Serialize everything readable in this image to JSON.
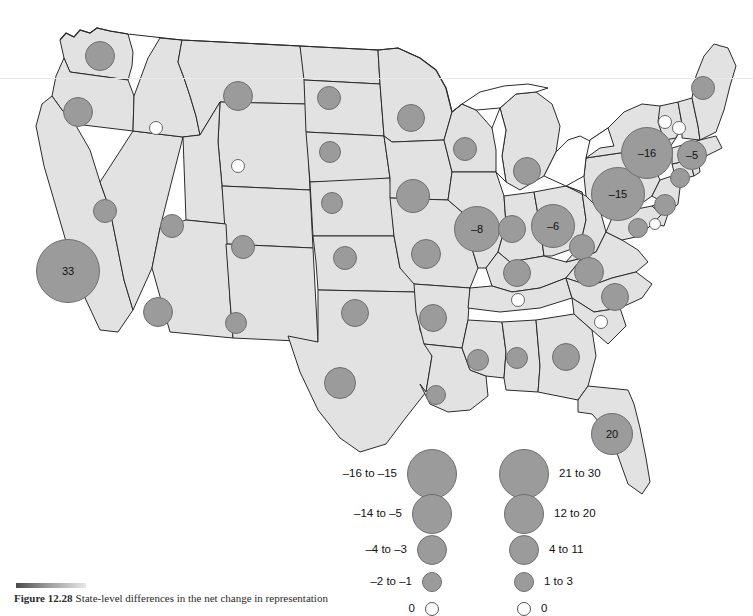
{
  "figure": {
    "caption_label": "Figure 12.28",
    "caption_text": "State-level differences in the net change in representation",
    "map_fill_color": "#e2e2e2",
    "map_stroke_color": "#2b2b2b",
    "bubble_fill_color": "#9b9b9b",
    "bubble_stroke_color": "#6f6f6f",
    "zero_fill_color": "#ffffff"
  },
  "chart_data": {
    "type": "bubble-map",
    "title": "Figure 12.28",
    "region": "United States",
    "value_unit": "net change",
    "legend": {
      "position": "bottom-center",
      "negative_column": [
        {
          "label": "-16 to -15",
          "radius_px": 25
        },
        {
          "label": "-14 to -5",
          "radius_px": 20
        },
        {
          "label": "-4 to -3",
          "radius_px": 15
        },
        {
          "label": "-2 to -1",
          "radius_px": 10
        },
        {
          "label": "0",
          "radius_px": 7
        }
      ],
      "positive_column": [
        {
          "label": "21 to 30",
          "radius_px": 25
        },
        {
          "label": "12 to 20",
          "radius_px": 20
        },
        {
          "label": "4 to 11",
          "radius_px": 15
        },
        {
          "label": "1 to 3",
          "radius_px": 10
        },
        {
          "label": "0",
          "radius_px": 7
        }
      ]
    },
    "labeled_values": [
      {
        "state": "California",
        "value": 33
      },
      {
        "state": "Florida",
        "value": 20
      },
      {
        "state": "New York",
        "value": -16
      },
      {
        "state": "Pennsylvania",
        "value": -15
      },
      {
        "state": "Illinois",
        "value": -8
      },
      {
        "state": "Ohio",
        "value": -6
      },
      {
        "state": "Massachusetts",
        "value": -5
      }
    ],
    "zero_states": [
      "Idaho",
      "Wyoming",
      "Tennessee",
      "South Carolina",
      "Vermont",
      "New Hampshire",
      "Delaware"
    ],
    "bubbles": [
      {
        "state": "Washington",
        "x": 100,
        "y": 56,
        "r": 15,
        "kind": "pos",
        "label": ""
      },
      {
        "state": "Oregon",
        "x": 78,
        "y": 112,
        "r": 15,
        "kind": "pos",
        "label": ""
      },
      {
        "state": "Idaho",
        "x": 156,
        "y": 128,
        "r": 7,
        "kind": "zero",
        "label": ""
      },
      {
        "state": "Montana",
        "x": 238,
        "y": 96,
        "r": 15,
        "kind": "pos",
        "label": ""
      },
      {
        "state": "Wyoming",
        "x": 238,
        "y": 166,
        "r": 7,
        "kind": "zero",
        "label": ""
      },
      {
        "state": "Nevada",
        "x": 105,
        "y": 211,
        "r": 12,
        "kind": "pos",
        "label": ""
      },
      {
        "state": "Utah",
        "x": 172,
        "y": 226,
        "r": 12,
        "kind": "pos",
        "label": ""
      },
      {
        "state": "Colorado",
        "x": 243,
        "y": 247,
        "r": 12,
        "kind": "pos",
        "label": ""
      },
      {
        "state": "Arizona",
        "x": 158,
        "y": 312,
        "r": 15,
        "kind": "pos",
        "label": ""
      },
      {
        "state": "New Mexico",
        "x": 236,
        "y": 323,
        "r": 11,
        "kind": "pos",
        "label": ""
      },
      {
        "state": "California",
        "x": 68,
        "y": 271,
        "r": 32,
        "kind": "pos",
        "label": "33"
      },
      {
        "state": "North Dakota",
        "x": 329,
        "y": 98,
        "r": 12,
        "kind": "pos",
        "label": ""
      },
      {
        "state": "South Dakota",
        "x": 330,
        "y": 152,
        "r": 11,
        "kind": "pos",
        "label": ""
      },
      {
        "state": "Nebraska",
        "x": 332,
        "y": 203,
        "r": 11,
        "kind": "pos",
        "label": ""
      },
      {
        "state": "Kansas",
        "x": 345,
        "y": 258,
        "r": 12,
        "kind": "pos",
        "label": ""
      },
      {
        "state": "Oklahoma",
        "x": 355,
        "y": 313,
        "r": 14,
        "kind": "pos",
        "label": ""
      },
      {
        "state": "Texas",
        "x": 340,
        "y": 383,
        "r": 16,
        "kind": "pos",
        "label": ""
      },
      {
        "state": "Minnesota",
        "x": 411,
        "y": 118,
        "r": 14,
        "kind": "pos",
        "label": ""
      },
      {
        "state": "Iowa",
        "x": 413,
        "y": 196,
        "r": 17,
        "kind": "pos",
        "label": ""
      },
      {
        "state": "Missouri",
        "x": 426,
        "y": 254,
        "r": 15,
        "kind": "pos",
        "label": ""
      },
      {
        "state": "Arkansas",
        "x": 433,
        "y": 318,
        "r": 14,
        "kind": "pos",
        "label": ""
      },
      {
        "state": "Louisiana",
        "x": 436,
        "y": 395,
        "r": 10,
        "kind": "pos",
        "label": ""
      },
      {
        "state": "Wisconsin",
        "x": 465,
        "y": 149,
        "r": 12,
        "kind": "pos",
        "label": ""
      },
      {
        "state": "Illinois",
        "x": 477,
        "y": 229,
        "r": 23,
        "kind": "neg",
        "label": "-8"
      },
      {
        "state": "Mississippi",
        "x": 478,
        "y": 360,
        "r": 11,
        "kind": "pos",
        "label": ""
      },
      {
        "state": "Michigan",
        "x": 527,
        "y": 171,
        "r": 14,
        "kind": "pos",
        "label": ""
      },
      {
        "state": "Indiana",
        "x": 512,
        "y": 229,
        "r": 14,
        "kind": "pos",
        "label": ""
      },
      {
        "state": "Kentucky",
        "x": 517,
        "y": 273,
        "r": 14,
        "kind": "pos",
        "label": ""
      },
      {
        "state": "Tennessee",
        "x": 518,
        "y": 300,
        "r": 7,
        "kind": "zero",
        "label": ""
      },
      {
        "state": "Alabama",
        "x": 517,
        "y": 358,
        "r": 11,
        "kind": "pos",
        "label": ""
      },
      {
        "state": "Ohio",
        "x": 553,
        "y": 226,
        "r": 22,
        "kind": "neg",
        "label": "-6"
      },
      {
        "state": "Georgia",
        "x": 566,
        "y": 357,
        "r": 14,
        "kind": "pos",
        "label": ""
      },
      {
        "state": "Florida",
        "x": 612,
        "y": 434,
        "r": 21,
        "kind": "pos",
        "label": "20"
      },
      {
        "state": "West Virginia",
        "x": 582,
        "y": 247,
        "r": 13,
        "kind": "pos",
        "label": ""
      },
      {
        "state": "Virginia",
        "x": 589,
        "y": 272,
        "r": 15,
        "kind": "pos",
        "label": ""
      },
      {
        "state": "North Carolina",
        "x": 615,
        "y": 297,
        "r": 14,
        "kind": "pos",
        "label": ""
      },
      {
        "state": "South Carolina",
        "x": 601,
        "y": 322,
        "r": 7,
        "kind": "zero",
        "label": ""
      },
      {
        "state": "Pennsylvania",
        "x": 618,
        "y": 194,
        "r": 27,
        "kind": "neg",
        "label": "-15"
      },
      {
        "state": "New York",
        "x": 647,
        "y": 153,
        "r": 26,
        "kind": "neg",
        "label": "-16"
      },
      {
        "state": "Maryland",
        "x": 638,
        "y": 228,
        "r": 10,
        "kind": "pos",
        "label": ""
      },
      {
        "state": "Delaware",
        "x": 655,
        "y": 224,
        "r": 6,
        "kind": "zero",
        "label": ""
      },
      {
        "state": "New Jersey",
        "x": 665,
        "y": 205,
        "r": 11,
        "kind": "pos",
        "label": ""
      },
      {
        "state": "Connecticut",
        "x": 680,
        "y": 178,
        "r": 10,
        "kind": "pos",
        "label": ""
      },
      {
        "state": "Massachusetts",
        "x": 692,
        "y": 155,
        "r": 15,
        "kind": "neg",
        "label": "-5"
      },
      {
        "state": "Vermont",
        "x": 665,
        "y": 122,
        "r": 7,
        "kind": "zero",
        "label": ""
      },
      {
        "state": "New Hampshire",
        "x": 679,
        "y": 128,
        "r": 7,
        "kind": "zero",
        "label": ""
      },
      {
        "state": "Maine",
        "x": 703,
        "y": 88,
        "r": 12,
        "kind": "pos",
        "label": ""
      }
    ]
  }
}
